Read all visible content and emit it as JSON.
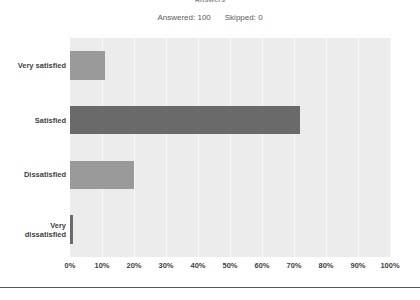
{
  "header": {
    "title": "Answers",
    "answered_label": "Answered: 100",
    "skipped_label": "Skipped: 0"
  },
  "colors": {
    "plot_background": "#ececec",
    "gridline": "#f7f7f7",
    "bar_light": "#9a9a9a",
    "bar_dark": "#6a6a6a",
    "label_text": "#3f3f3f",
    "summary_text": "#5b5b5b"
  },
  "chart_data": {
    "type": "bar",
    "orientation": "horizontal",
    "title": "Answers",
    "subtitle": "Answered: 100    Skipped: 0",
    "xlabel": "",
    "ylabel": "",
    "xlim": [
      0,
      100
    ],
    "grid": true,
    "legend": "none",
    "categories": [
      "Very satisfied",
      "Satisfied",
      "Dissatisfied",
      "Very dissatisfied"
    ],
    "values": [
      11,
      72,
      20,
      1
    ],
    "tick_labels": [
      "0%",
      "10%",
      "20%",
      "30%",
      "40%",
      "50%",
      "60%",
      "70%",
      "80%",
      "90%",
      "100%"
    ],
    "tick_values": [
      0,
      10,
      20,
      30,
      40,
      50,
      60,
      70,
      80,
      90,
      100
    ],
    "bars": [
      {
        "label": "Very satisfied",
        "label_lines": [
          "Very satisfied"
        ],
        "value": 11,
        "color": "#9a9a9a"
      },
      {
        "label": "Satisfied",
        "label_lines": [
          "Satisfied"
        ],
        "value": 72,
        "color": "#6a6a6a"
      },
      {
        "label": "Dissatisfied",
        "label_lines": [
          "Dissatisfied"
        ],
        "value": 20,
        "color": "#9a9a9a"
      },
      {
        "label": "Very dissatisfied",
        "label_lines": [
          "Very",
          "dissatisfied"
        ],
        "value": 1,
        "color": "#6a6a6a"
      }
    ]
  }
}
